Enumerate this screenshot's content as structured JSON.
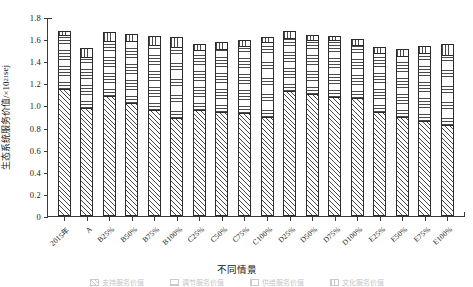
{
  "chart_data": {
    "type": "bar",
    "stacked": true,
    "title": "",
    "xlabel": "不同情景",
    "ylabel": "生态系统服务价值/×10",
    "ylabel_exponent": "21",
    "ylabel_unit": "sej",
    "ylim": [
      0,
      1.8
    ],
    "yticks": [
      "0",
      "0.2",
      "0.4",
      "0.6",
      "0.8",
      "1.0",
      "1.2",
      "1.4",
      "1.6",
      "1.8"
    ],
    "ytick_values": [
      0,
      0.2,
      0.4,
      0.6,
      0.8,
      1.0,
      1.2,
      1.4,
      1.6,
      1.8
    ],
    "grid": false,
    "legend_position": "bottom",
    "legend_clipped": true,
    "categories": [
      "2015年",
      "A",
      "B25%",
      "B50%",
      "B75%",
      "B100%",
      "C25%",
      "C50%",
      "C75%",
      "C100%",
      "D25%",
      "D50%",
      "D75%",
      "D100%",
      "E25%",
      "E50%",
      "E75%",
      "E100%"
    ],
    "series": [
      {
        "name": "支持服务价值",
        "hatch": "diagonal",
        "values": [
          1.15,
          0.98,
          1.09,
          1.02,
          0.96,
          0.89,
          0.96,
          0.94,
          0.93,
          0.9,
          1.13,
          1.1,
          1.08,
          1.07,
          0.94,
          0.9,
          0.86,
          0.82
        ]
      },
      {
        "name": "调节服务价值",
        "hatch": "horizontal",
        "values": [
          0.5,
          0.47,
          0.5,
          0.57,
          0.6,
          0.65,
          0.55,
          0.58,
          0.62,
          0.68,
          0.49,
          0.5,
          0.52,
          0.49,
          0.54,
          0.56,
          0.62,
          0.65
        ]
      },
      {
        "name": "供给服务价值",
        "hatch": "vertical",
        "values": [
          0.04,
          0.09,
          0.09,
          0.07,
          0.09,
          0.1,
          0.06,
          0.07,
          0.06,
          0.06,
          0.07,
          0.06,
          0.05,
          0.06,
          0.07,
          0.07,
          0.08,
          0.1
        ]
      }
    ],
    "totals": [
      1.69,
      1.54,
      1.68,
      1.66,
      1.65,
      1.64,
      1.57,
      1.59,
      1.61,
      1.64,
      1.69,
      1.66,
      1.65,
      1.62,
      1.55,
      1.53,
      1.56,
      1.57
    ]
  },
  "legend": {
    "items": [
      {
        "label": "支持服务价值",
        "hatch": "diagonal"
      },
      {
        "label": "调节服务价值",
        "hatch": "horizontal"
      },
      {
        "label": "供给服务价值",
        "hatch": "vertical"
      },
      {
        "label": "文化服务价值",
        "hatch": "vertical"
      }
    ]
  },
  "colors": {
    "axis": "#3a3a3a",
    "bar_edge": "#2b2b2b",
    "hatch": "#4a4a4a",
    "background": "#ffffff",
    "text": "#1a1a1a"
  }
}
